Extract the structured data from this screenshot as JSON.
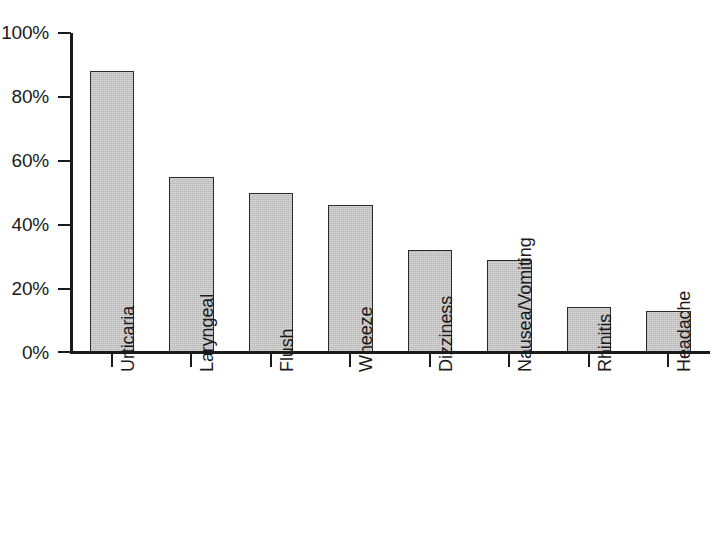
{
  "chart_data": {
    "type": "bar",
    "title": "",
    "subtitle": "",
    "xlabel": "",
    "ylabel": "",
    "categories": [
      "Urticaria",
      "Laryngeal",
      "Flush",
      "Wheeze",
      "Dizziness",
      "Nausea/Vomiting",
      "Rhinitis",
      "Headache"
    ],
    "values": [
      88,
      55,
      50,
      46,
      32,
      29,
      14,
      13
    ],
    "value_labels": [
      "88%",
      "55%",
      "50%",
      "46%",
      "32%",
      "29%",
      "14%",
      "13%"
    ],
    "ylim": [
      0,
      100
    ],
    "ytick_values": [
      0,
      20,
      40,
      60,
      80,
      100
    ],
    "ytick_labels": [
      "0%",
      "20%",
      "40%",
      "60%",
      "80%",
      "100%"
    ],
    "grid": false,
    "legend": null,
    "legend_position": "none",
    "annotations": [],
    "bar_fill_color": "#c4c4c4",
    "bar_edge_color": "#2a2a2a",
    "axis_color": "#1a1a1a"
  }
}
